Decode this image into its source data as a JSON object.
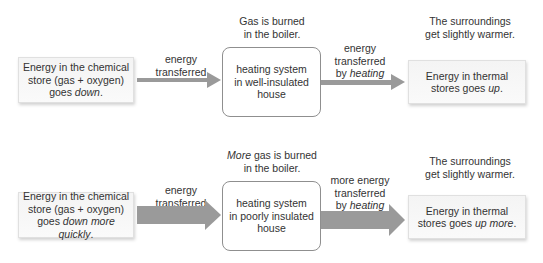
{
  "rows": [
    {
      "source_box": {
        "line1": "Energy in the chemical",
        "line2": "store (gas + oxygen)",
        "line3_pre": "goes ",
        "line3_em": "down",
        "line3_post": "."
      },
      "arrow1_label": {
        "line1": "energy",
        "line2": "transferred"
      },
      "heater_note": {
        "em": "",
        "line1_rest": "Gas is burned",
        "line2": "in the boiler."
      },
      "heater_box": {
        "line1": "heating system",
        "line2": "in well-insulated",
        "line3": "house"
      },
      "arrow2_label": {
        "line1": "energy",
        "line2": "transferred",
        "line3_pre": "by ",
        "line3_em": "heating"
      },
      "result_note": {
        "line1": "The surroundings",
        "line2": "get slightly warmer."
      },
      "result_box": {
        "line1": "Energy in thermal",
        "line2_pre": "stores goes ",
        "line2_em": "up",
        "line2_post": "."
      }
    },
    {
      "source_box": {
        "line1": "Energy in the chemical",
        "line2": "store (gas + oxygen)",
        "line3_pre": "goes ",
        "line3_em": "down more quickly",
        "line3_post": "."
      },
      "arrow1_label": {
        "line1": "energy",
        "line2": "transferred"
      },
      "heater_note": {
        "em": "More",
        "line1_rest": " gas is burned",
        "line2": "in the boiler."
      },
      "heater_box": {
        "line1": "heating system",
        "line2": "in poorly insulated",
        "line3": "house"
      },
      "arrow2_label": {
        "line1": "more energy",
        "line2": "transferred",
        "line3_pre": "by ",
        "line3_em": "heating"
      },
      "result_note": {
        "line1": "The surroundings",
        "line2": "get slightly warmer."
      },
      "result_box": {
        "line1": "Energy in thermal",
        "line2_pre": "stores goes ",
        "line2_em": "up more",
        "line2_post": "."
      }
    }
  ],
  "colors": {
    "arrow": "#9a9a9a",
    "text": "#333333",
    "box_border": "#8f8f8f"
  }
}
